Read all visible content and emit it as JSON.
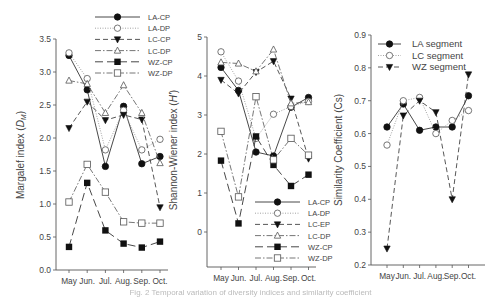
{
  "caption": "Fig. 2 Temporal variation of diversity indices and similarity coefficient",
  "chart_data": [
    {
      "type": "line",
      "title": "",
      "xlabel": "",
      "ylabel": "Margalef index (D_M)",
      "ylabel_main": "Margalef index (",
      "ylabel_sym": "D",
      "ylabel_sub": "M",
      "ylim": [
        0,
        3.5
      ],
      "yticks": [
        "0.0",
        "0.5",
        "1.0",
        "1.5",
        "2.0",
        "2.5",
        "3.0",
        "3.5"
      ],
      "categories": [
        "May",
        "Jun.",
        "Jul.",
        "Aug.",
        "Sep.",
        "Oct."
      ],
      "legend_position": "top-right",
      "grid": false,
      "series": [
        {
          "name": "LA-CP",
          "marker": "filled-circle",
          "line": "solid",
          "values": [
            3.25,
            2.73,
            1.57,
            2.48,
            1.61,
            1.72
          ]
        },
        {
          "name": "LA-DP",
          "marker": "open-circle",
          "line": "dotted",
          "values": [
            3.29,
            2.9,
            1.82,
            2.42,
            1.82,
            1.98
          ]
        },
        {
          "name": "LC-CP",
          "marker": "filled-triangle-down",
          "line": "dashed",
          "values": [
            2.15,
            2.55,
            2.27,
            2.35,
            2.28,
            0.95
          ]
        },
        {
          "name": "LC-DP",
          "marker": "open-triangle-up",
          "line": "dash-dot",
          "values": [
            2.87,
            2.82,
            2.38,
            2.8,
            2.38,
            1.62
          ]
        },
        {
          "name": "WZ-CP",
          "marker": "filled-square",
          "line": "long-dash",
          "values": [
            0.35,
            1.32,
            0.6,
            0.4,
            0.34,
            0.43
          ]
        },
        {
          "name": "WZ-DP",
          "marker": "open-square",
          "line": "dash-dot",
          "values": [
            1.03,
            1.6,
            1.18,
            0.73,
            0.71,
            0.71
          ]
        }
      ]
    },
    {
      "type": "line",
      "title": "",
      "xlabel": "",
      "ylabel": "Shannon-Wiener index (H')",
      "ylabel_main": "Shannon-Wiener index (",
      "ylabel_sym": "H'",
      "ylim": [
        -0.9,
        5
      ],
      "yticks": [
        "0",
        "1",
        "2",
        "3",
        "4",
        "5"
      ],
      "categories": [
        "May",
        "Jun.",
        "Jul.",
        "Aug.",
        "Sep.",
        "Oct."
      ],
      "legend_position": "bottom-right",
      "grid": false,
      "series": [
        {
          "name": "LA-CP",
          "marker": "filled-circle",
          "line": "solid",
          "values": [
            4.22,
            3.63,
            2.05,
            1.95,
            3.2,
            3.45
          ]
        },
        {
          "name": "LA-DP",
          "marker": "open-circle",
          "line": "dotted",
          "values": [
            4.62,
            3.87,
            2.4,
            3.02,
            3.22,
            3.35
          ]
        },
        {
          "name": "LC-EP",
          "marker": "filled-triangle-down",
          "line": "dashed",
          "values": [
            3.9,
            3.55,
            4.1,
            4.38,
            3.42,
            1.88
          ]
        },
        {
          "name": "LC-DP",
          "marker": "open-triangle-up",
          "line": "dash-dot",
          "values": [
            4.35,
            4.32,
            4.12,
            4.68,
            3.3,
            3.33
          ]
        },
        {
          "name": "WZ-CP",
          "marker": "filled-square",
          "line": "long-dash",
          "values": [
            1.83,
            0.22,
            2.45,
            1.72,
            1.18,
            1.47
          ]
        },
        {
          "name": "WZ-DP",
          "marker": "open-square",
          "line": "dash-dot",
          "values": [
            2.58,
            0.9,
            3.47,
            1.85,
            2.4,
            1.97
          ]
        }
      ]
    },
    {
      "type": "line",
      "title": "",
      "xlabel": "",
      "ylabel": "Similarity Coefficient (Cs)",
      "ylim": [
        0.2,
        0.9
      ],
      "yticks": [
        "0.2",
        "0.3",
        "0.4",
        "0.5",
        "0.6",
        "0.7",
        "0.8",
        "0.9"
      ],
      "categories": [
        "May",
        "Jun.",
        "Jul.",
        "Aug.",
        "Sep.",
        "Oct."
      ],
      "legend_position": "top-left",
      "grid": false,
      "series": [
        {
          "name": "LA segment",
          "marker": "filled-circle",
          "line": "solid",
          "values": [
            0.62,
            0.69,
            0.61,
            0.62,
            0.62,
            0.715
          ]
        },
        {
          "name": "LC segment",
          "marker": "open-circle",
          "line": "dotted",
          "values": [
            0.565,
            0.7,
            0.71,
            0.6,
            0.64,
            0.67
          ]
        },
        {
          "name": "WZ segment",
          "marker": "filled-triangle-down",
          "line": "dashed",
          "values": [
            0.25,
            0.655,
            0.7,
            0.665,
            0.4,
            0.78
          ]
        }
      ]
    }
  ]
}
